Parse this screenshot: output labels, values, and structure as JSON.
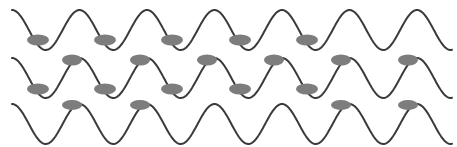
{
  "figure": {
    "width": 457,
    "height": 147,
    "background_color": "#ffffff"
  },
  "chart_data": {
    "type": "line",
    "subtitle": "",
    "xlabel": "",
    "ylabel": "",
    "xlim": [
      0,
      457
    ],
    "ylim": [
      0,
      147
    ],
    "grid": false,
    "legend": "none",
    "axes_visible": false,
    "tick_labels": [],
    "annotations": [],
    "wave": {
      "shape": "sine",
      "period_px": 67.5,
      "amplitude_px": 20,
      "stroke_color": "#3a3a3a",
      "stroke_width": 2.0,
      "x_start": 12,
      "x_end": 452
    },
    "series": [
      {
        "name": "wave-1",
        "baseline_y": 30,
        "phase_deg": 90,
        "x_start": 12,
        "x_end": 452,
        "stroke_color": "#3a3a3a"
      },
      {
        "name": "wave-2",
        "baseline_y": 78,
        "phase_deg": 90,
        "x_start": 12,
        "x_end": 452,
        "stroke_color": "#3a3a3a"
      },
      {
        "name": "wave-3",
        "baseline_y": 124,
        "phase_deg": 90,
        "x_start": 12,
        "x_end": 452,
        "stroke_color": "#3a3a3a"
      }
    ],
    "particles": {
      "fill_color": "#7d7d7d",
      "rows": [
        {
          "name": "particle-row-1",
          "cy": 40,
          "rx": 11,
          "ry": 5.5,
          "cx": [
            38,
            105,
            172,
            240,
            307
          ]
        },
        {
          "name": "particle-row-2",
          "cy": 60,
          "rx": 10,
          "ry": 5.5,
          "cx": [
            72,
            140,
            207,
            274,
            341,
            408
          ]
        },
        {
          "name": "particle-row-3",
          "cy": 89,
          "rx": 11,
          "ry": 5.5,
          "cx": [
            38,
            105,
            172,
            240,
            307
          ]
        },
        {
          "name": "particle-row-4",
          "cy": 105,
          "rx": 10,
          "ry": 5.0,
          "cx": [
            72,
            140,
            341,
            408
          ]
        }
      ]
    }
  }
}
